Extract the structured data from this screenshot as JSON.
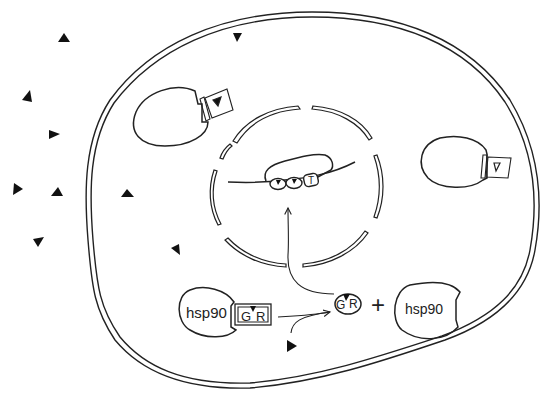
{
  "diagram": {
    "colors": {
      "ink": "#222222",
      "background": "#ffffff"
    },
    "labels": {
      "hsp90_bound": "hsp90",
      "gr_bound_g": "G",
      "gr_bound_r": "R",
      "gr_free_g": "G",
      "gr_free_r": "R",
      "plus": "+",
      "hsp90_free": "hsp90",
      "dna_box": "T"
    },
    "elements": [
      {
        "id": "cell-membrane",
        "type": "double-membrane"
      },
      {
        "id": "nuclear-envelope",
        "type": "segmented-double-membrane",
        "segments": 8
      },
      {
        "id": "dna-strand",
        "type": "line"
      },
      {
        "id": "transcription-complex",
        "type": "blob",
        "bound_sites": 3
      },
      {
        "id": "receptor-left",
        "type": "membrane-receptor-with-ligand-slot"
      },
      {
        "id": "receptor-right",
        "type": "membrane-receptor-with-ligand-slot"
      },
      {
        "id": "hsp90-gr-complex",
        "type": "complex"
      },
      {
        "id": "gr-hormone",
        "type": "activated-receptor"
      },
      {
        "id": "hsp90-free",
        "type": "chaperone"
      },
      {
        "id": "hormone-triangles",
        "type": "ligand",
        "count": 12
      }
    ],
    "arrows": [
      {
        "from": "hsp90-gr-complex",
        "to": "gr-hormone"
      },
      {
        "from": "hormone-in-cytoplasm",
        "to": "gr-hormone"
      },
      {
        "from": "gr-hormone",
        "to": "dna-strand"
      }
    ],
    "hormones": [
      {
        "x": 64,
        "y": 37,
        "rot": 0
      },
      {
        "x": 237,
        "y": 37,
        "rot": 180
      },
      {
        "x": 27,
        "y": 97,
        "rot": -20
      },
      {
        "x": 54,
        "y": 134,
        "rot": 90
      },
      {
        "x": 17,
        "y": 189,
        "rot": 80
      },
      {
        "x": 57,
        "y": 192,
        "rot": 0
      },
      {
        "x": 127,
        "y": 193,
        "rot": 10
      },
      {
        "x": 39,
        "y": 243,
        "rot": 200
      },
      {
        "x": 176,
        "y": 250,
        "rot": -30
      },
      {
        "x": 291,
        "y": 346,
        "rot": 100
      }
    ]
  }
}
